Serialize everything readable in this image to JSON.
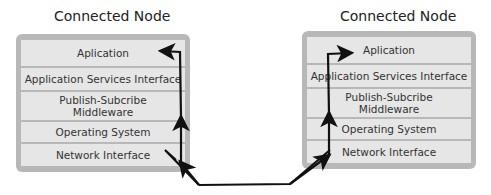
{
  "nodes": [
    {
      "title": "Connected Node",
      "layers": [
        {
          "label": "Aplication"
        },
        {
          "label": "Application Services Interface"
        },
        {
          "label": "Publish-Subcribe Middleware"
        },
        {
          "label": "Operating System"
        },
        {
          "label": "Network Interface"
        }
      ]
    },
    {
      "title": "Connected Node",
      "layers": [
        {
          "label": "Aplication"
        },
        {
          "label": "Application Services Interface"
        },
        {
          "label": "Publish-Subcribe Middleware"
        },
        {
          "label": "Operating System"
        },
        {
          "label": "Network Interface"
        }
      ]
    }
  ],
  "colors": {
    "node_border": "#b8b8b8",
    "layer_fill": "#e6e6e6",
    "arrow": "#111111"
  }
}
